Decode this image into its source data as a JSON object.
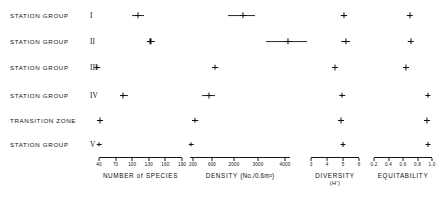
{
  "figure": {
    "type": "multi-panel-dot-plot",
    "background": "#ffffff",
    "ink_color": "#121212"
  },
  "rows": [
    {
      "id": "station-group-1",
      "name": "STATION  GROUP",
      "roman": "I",
      "y": 15
    },
    {
      "id": "station-group-2",
      "name": "STATION  GROUP",
      "roman": "II",
      "y": 41
    },
    {
      "id": "station-group-3",
      "name": "STATION  GROUP",
      "roman": "III",
      "y": 67
    },
    {
      "id": "station-group-4",
      "name": "STATION  GROUP",
      "roman": "IV",
      "y": 95
    },
    {
      "id": "transition-zone",
      "name": "TRANSITION  ZONE",
      "roman": "",
      "y": 120
    },
    {
      "id": "station-group-5",
      "name": "STATION  GROUP",
      "roman": "V",
      "y": 144
    }
  ],
  "chart_data": [
    {
      "id": "panel-species",
      "type": "scatter",
      "title": "NUMBER of SPECIES",
      "subtitle": "",
      "xlabel": "NUMBER of SPECIES",
      "ylabel": "",
      "axis_px": {
        "left": 99,
        "right": 182,
        "y": 157
      },
      "ticks": [
        40,
        70,
        100,
        130,
        160,
        190
      ],
      "tick_labels": [
        "40",
        "70",
        "100",
        "130",
        "160",
        "190"
      ],
      "xlim": [
        32,
        198
      ],
      "categories": [
        "STATION GROUP I",
        "STATION GROUP II",
        "STATION GROUP III",
        "STATION GROUP IV",
        "TRANSITION ZONE",
        "STATION GROUP V"
      ],
      "values": [
        110,
        133,
        37,
        84,
        41,
        40
      ],
      "err_low": [
        100,
        126,
        34,
        78,
        36,
        39
      ],
      "err_high": [
        122,
        142,
        41,
        92,
        47,
        41
      ],
      "marker_size": [
        6.5,
        6.5,
        5.5,
        6.0,
        6.0,
        4.5
      ]
    },
    {
      "id": "panel-density",
      "type": "scatter",
      "title": "DENSITY",
      "unit": "(No./0.6m²)",
      "xlabel": "DENSITY (No./0.6m²)",
      "ylabel": "",
      "axis_px": {
        "left": 190,
        "right": 290,
        "y": 157
      },
      "ticks": [
        200,
        600,
        2000,
        3000,
        4000
      ],
      "tick_labels": [
        "200",
        "600",
        "2000",
        "3000",
        "4000"
      ],
      "tick_px": [
        193,
        212,
        234,
        258,
        285
      ],
      "xlim_px": [
        190,
        290
      ],
      "categories": [
        "STATION GROUP I",
        "STATION GROUP II",
        "STATION GROUP III",
        "STATION GROUP IV",
        "TRANSITION ZONE",
        "STATION GROUP V"
      ],
      "values_px": [
        243,
        288,
        215,
        209,
        195,
        191
      ],
      "err_low_px": [
        228,
        266,
        212,
        202,
        192,
        190
      ],
      "err_high_px": [
        255,
        307,
        218,
        215,
        198,
        192
      ],
      "marker_size": [
        6.5,
        6.5,
        5.5,
        6.0,
        5.5,
        4.5
      ]
    },
    {
      "id": "panel-diversity",
      "type": "scatter",
      "title": "DIVERSITY",
      "subtitle": "(H')",
      "xlabel": "DIVERSITY (H')",
      "ylabel": "",
      "axis_px": {
        "left": 311,
        "right": 359,
        "y": 157
      },
      "ticks": [
        3,
        4,
        5,
        6
      ],
      "tick_labels": [
        "3",
        "4",
        "5",
        "6"
      ],
      "xlim": [
        2.8,
        6.2
      ],
      "categories": [
        "STATION GROUP I",
        "STATION GROUP II",
        "STATION GROUP III",
        "STATION GROUP IV",
        "TRANSITION ZONE",
        "STATION GROUP V"
      ],
      "values": [
        5.05,
        5.2,
        4.5,
        4.95,
        4.85,
        5.0
      ],
      "err_low": [
        4.85,
        4.9,
        4.35,
        4.9,
        4.78,
        4.95
      ],
      "err_high": [
        5.25,
        5.45,
        4.65,
        5.0,
        4.92,
        5.05
      ],
      "marker_size": [
        6.5,
        6.5,
        6.0,
        5.5,
        6.0,
        5.0
      ]
    },
    {
      "id": "panel-equitability",
      "type": "scatter",
      "title": "EQUITABILITY",
      "subtitle": "",
      "xlabel": "EQUITABILITY",
      "ylabel": "",
      "axis_px": {
        "left": 374,
        "right": 432,
        "y": 157
      },
      "ticks": [
        0.2,
        0.4,
        0.6,
        0.8,
        1.0
      ],
      "tick_labels": [
        "0.2",
        "0.4",
        "0.6",
        "0.8",
        "1.0"
      ],
      "xlim": [
        0.14,
        1.06
      ],
      "categories": [
        "STATION GROUP I",
        "STATION GROUP II",
        "STATION GROUP III",
        "STATION GROUP IV",
        "TRANSITION ZONE",
        "STATION GROUP V"
      ],
      "values": [
        0.69,
        0.71,
        0.64,
        0.94,
        0.93,
        0.94
      ],
      "err_low": [
        0.67,
        0.69,
        0.625,
        0.925,
        0.915,
        0.935
      ],
      "err_high": [
        0.71,
        0.73,
        0.655,
        0.955,
        0.945,
        0.945
      ],
      "marker_size": [
        6.5,
        6.5,
        6.0,
        5.5,
        6.0,
        5.0
      ]
    }
  ]
}
